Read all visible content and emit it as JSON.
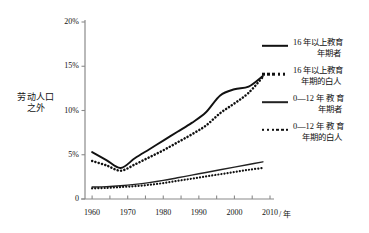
{
  "chart_data": {
    "type": "line",
    "title": "",
    "xlabel": "/ 年",
    "ylabel": "劳动人口\n之外",
    "ylabel_line1": "劳动人口",
    "ylabel_line2": "之外",
    "xlim": [
      1958,
      2010
    ],
    "ylim": [
      0,
      20
    ],
    "grid": false,
    "legend_position": "right",
    "y_ticks": [
      "0",
      "5%",
      "10%",
      "15%",
      "20%"
    ],
    "y_tick_values": [
      0,
      5,
      10,
      15,
      20
    ],
    "x_ticks": [
      "1960",
      "1970",
      "1980",
      "1990",
      "2000",
      "2010"
    ],
    "x_tick_values": [
      1960,
      1970,
      1980,
      1990,
      2000,
      2010
    ],
    "x_minor_tick_values": [
      1960,
      1965,
      1970,
      1975,
      1980,
      1985,
      1990,
      1995,
      2000,
      2005,
      2010
    ],
    "series": [
      {
        "name": "16 年以上教育年期者",
        "name_line1": "16 年以上教育",
        "name_line2": "年期者",
        "style": "solid",
        "width": "thick",
        "color": "#111111",
        "x": [
          1960,
          1964,
          1968,
          1972,
          1976,
          1980,
          1984,
          1988,
          1992,
          1996,
          2000,
          2004,
          2008
        ],
        "values": [
          5.3,
          4.4,
          3.5,
          4.6,
          5.6,
          6.6,
          7.6,
          8.6,
          9.8,
          11.7,
          12.4,
          12.7,
          13.9
        ]
      },
      {
        "name": "16 年以上教育年期的白人",
        "name_line1": "16 年以上教育",
        "name_line2": "年期的白人",
        "style": "dotted",
        "width": "thick",
        "color": "#111111",
        "x": [
          1960,
          1964,
          1968,
          1972,
          1976,
          1980,
          1984,
          1988,
          1992,
          1996,
          2000,
          2004,
          2008
        ],
        "values": [
          4.3,
          3.8,
          3.2,
          3.9,
          4.7,
          5.5,
          6.4,
          7.3,
          8.3,
          9.7,
          10.8,
          12.0,
          13.8
        ]
      },
      {
        "name": "0—12 年 教 育 年期者",
        "name_line1": "0—12 年 教 育",
        "name_line2": "年期者",
        "style": "solid",
        "width": "thin",
        "color": "#222222",
        "x": [
          1960,
          1964,
          1968,
          1972,
          1976,
          1980,
          1984,
          1988,
          1992,
          1996,
          2000,
          2004,
          2008
        ],
        "values": [
          1.35,
          1.4,
          1.5,
          1.65,
          1.85,
          2.1,
          2.4,
          2.7,
          3.0,
          3.3,
          3.6,
          3.9,
          4.2
        ]
      },
      {
        "name": "0—12 年 教 育 年期的白人",
        "name_line1": "0—12 年 教 育",
        "name_line2": "年期的白人",
        "style": "dotted",
        "width": "thin",
        "color": "#111111",
        "x": [
          1960,
          1964,
          1968,
          1972,
          1976,
          1980,
          1984,
          1988,
          1992,
          1996,
          2000,
          2004,
          2008
        ],
        "values": [
          1.2,
          1.25,
          1.35,
          1.45,
          1.6,
          1.8,
          2.05,
          2.3,
          2.55,
          2.8,
          3.05,
          3.3,
          3.5
        ]
      }
    ]
  }
}
